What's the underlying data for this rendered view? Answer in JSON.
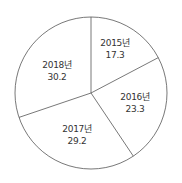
{
  "chart_data": {
    "type": "pie",
    "title": "",
    "categories": [
      "2015년",
      "2016년",
      "2017년",
      "2018년"
    ],
    "values": [
      17.3,
      23.3,
      29.2,
      30.2
    ],
    "start_angle_deg": 0,
    "direction": "clockwise",
    "legend": "none",
    "labels_inside": true,
    "colors": {
      "fill": "#ffffff",
      "stroke": "#555555",
      "text": "#333333"
    }
  },
  "slices": [
    {
      "label": "2015년",
      "value": "17.3"
    },
    {
      "label": "2016년",
      "value": "23.3"
    },
    {
      "label": "2017년",
      "value": "29.2"
    },
    {
      "label": "2018년",
      "value": "30.2"
    }
  ]
}
